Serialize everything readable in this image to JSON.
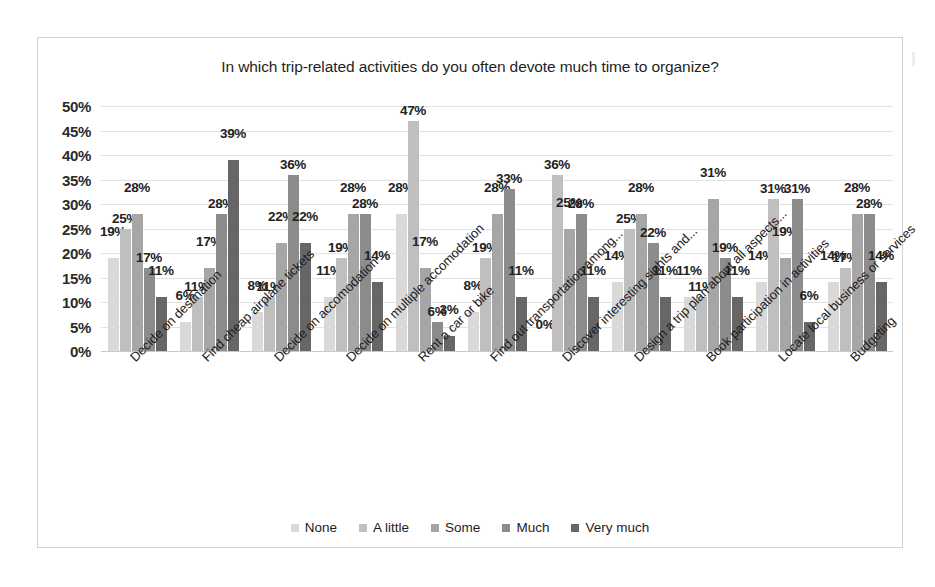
{
  "chart_data": {
    "type": "bar",
    "title": "In which trip-related activities do you often devote much time to organize?",
    "xlabel": "",
    "ylabel": "",
    "ylim": [
      0,
      50
    ],
    "ytick_labels": [
      "50%",
      "45%",
      "40%",
      "35%",
      "30%",
      "25%",
      "20%",
      "15%",
      "10%",
      "5%",
      "0%"
    ],
    "ytick_values": [
      50,
      45,
      40,
      35,
      30,
      25,
      20,
      15,
      10,
      5,
      0
    ],
    "grid": true,
    "legend_position": "bottom",
    "value_suffix": "%",
    "categories": [
      "Decide on destination",
      "Find cheap airplane tickets",
      "Decide on accomodation",
      "Decide on multiple accomodation",
      "Rent a car or bike",
      "Find out transportation among...",
      "Discover interesting sights and...",
      "Design a trip plan about all aspects...",
      "Book participation in activities",
      "Locate local business or services",
      "Budgeting"
    ],
    "series": [
      {
        "name": "None",
        "color": "#d9d9d9",
        "values": [
          19,
          6,
          8,
          11,
          28,
          8,
          0,
          14,
          11,
          14,
          14
        ],
        "labels": [
          "19%",
          "6%",
          "8%",
          "11%",
          "28%",
          "8%",
          "0%",
          "14%",
          "11%",
          "14%",
          "14%"
        ]
      },
      {
        "name": "A little",
        "color": "#bfbfbf",
        "values": [
          25,
          11,
          11,
          19,
          47,
          19,
          36,
          25,
          11,
          31,
          17
        ],
        "labels": [
          "25%",
          "11%",
          "11%",
          "19%",
          "47%",
          "19%",
          "36%",
          "25%",
          "11%",
          "31%",
          "17%"
        ]
      },
      {
        "name": "Some",
        "color": "#a6a6a6",
        "values": [
          28,
          17,
          22,
          28,
          17,
          28,
          25,
          28,
          31,
          19,
          28
        ],
        "labels": [
          "28%",
          "17%",
          "22%",
          "28%",
          "17%",
          "28%",
          "25%",
          "28%",
          "31%",
          "19%",
          "28%"
        ]
      },
      {
        "name": "Much",
        "color": "#8c8c8c",
        "values": [
          17,
          28,
          36,
          28,
          6,
          33,
          28,
          22,
          19,
          31,
          28
        ],
        "labels": [
          "17%",
          "28%",
          "36%",
          "28%",
          "6%",
          "33%",
          "28%",
          "22%",
          "19%",
          "31%",
          "28%"
        ]
      },
      {
        "name": "Very much",
        "color": "#666666",
        "values": [
          11,
          39,
          22,
          14,
          3,
          11,
          11,
          11,
          11,
          6,
          14
        ],
        "labels": [
          "11%",
          "39%",
          "22%",
          "14%",
          "3%",
          "11%",
          "11%",
          "11%",
          "11%",
          "6%",
          "14%"
        ]
      }
    ]
  },
  "caption": {
    "text": ""
  }
}
